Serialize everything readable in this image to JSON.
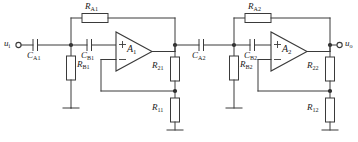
{
  "diagram": {
    "type": "schematic",
    "line_color": "#3a3a3a",
    "label_color": "#1a1a1a",
    "background": "#ffffff"
  },
  "terminals": {
    "input": {
      "name": "u",
      "sub": "i"
    },
    "output": {
      "name": "u",
      "sub": "o"
    }
  },
  "stage1": {
    "opamp": {
      "name": "A",
      "sub": "1",
      "plus": "+",
      "minus": "−"
    },
    "feedback_resistor": {
      "name": "R",
      "sub": "A1"
    },
    "series_cap_1": {
      "name": "C",
      "sub": "A1"
    },
    "shunt_resistor": {
      "name": "R",
      "sub": "B1"
    },
    "series_cap_2": {
      "name": "C",
      "sub": "B1"
    },
    "feedback_divider_top": {
      "name": "R",
      "sub": "21"
    },
    "feedback_divider_bottom": {
      "name": "R",
      "sub": "11"
    }
  },
  "stage2": {
    "opamp": {
      "name": "A",
      "sub": "2",
      "plus": "+",
      "minus": "−"
    },
    "feedback_resistor": {
      "name": "R",
      "sub": "A2"
    },
    "series_cap_1": {
      "name": "C",
      "sub": "A2"
    },
    "shunt_resistor": {
      "name": "R",
      "sub": "B2"
    },
    "series_cap_2": {
      "name": "C",
      "sub": "B2"
    },
    "feedback_divider_top": {
      "name": "R",
      "sub": "22"
    },
    "feedback_divider_bottom": {
      "name": "R",
      "sub": "12"
    }
  },
  "grounds": {
    "count": 6,
    "symbol": "earth"
  }
}
